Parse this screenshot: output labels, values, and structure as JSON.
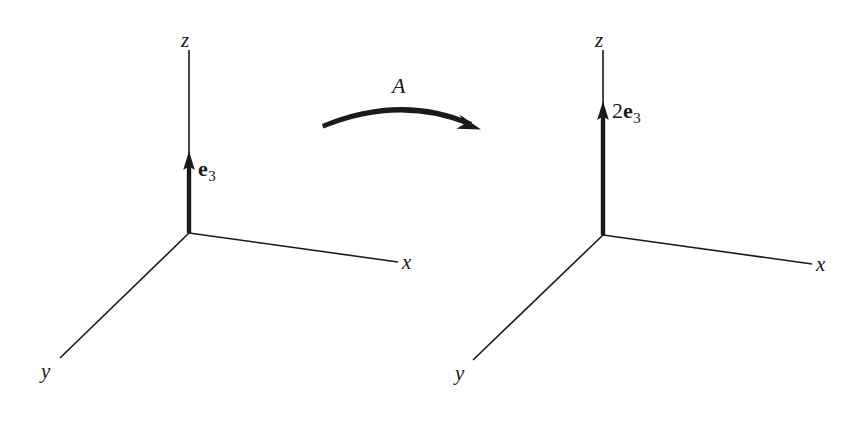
{
  "figure": {
    "background_color": "#ffffff",
    "ink_color": "#1a1a1a",
    "width": 866,
    "height": 426
  },
  "operator": {
    "label": "A"
  },
  "systems": [
    {
      "id": "left",
      "name": "domain-coordinate-system",
      "origin": {
        "x": 189,
        "y": 233
      },
      "axes": [
        {
          "name": "z",
          "label": "z",
          "end": {
            "x": 189,
            "y": 50
          },
          "label_pos": {
            "x": 181,
            "y": 30
          }
        },
        {
          "name": "x",
          "label": "x",
          "end": {
            "x": 398,
            "y": 262
          },
          "label_pos": {
            "x": 402,
            "y": 252
          }
        },
        {
          "name": "y",
          "label": "y",
          "end": {
            "x": 60,
            "y": 358
          },
          "label_pos": {
            "x": 41,
            "y": 361
          }
        }
      ],
      "vector": {
        "label_scalar": "",
        "label_basis": "e",
        "label_subscript": "3",
        "tip": {
          "x": 189,
          "y": 153
        },
        "label_pos": {
          "x": 198,
          "y": 158
        }
      }
    },
    {
      "id": "right",
      "name": "codomain-coordinate-system",
      "origin": {
        "x": 603,
        "y": 235
      },
      "axes": [
        {
          "name": "z",
          "label": "z",
          "end": {
            "x": 603,
            "y": 50
          },
          "label_pos": {
            "x": 595,
            "y": 30
          }
        },
        {
          "name": "x",
          "label": "x",
          "end": {
            "x": 812,
            "y": 264
          },
          "label_pos": {
            "x": 816,
            "y": 254
          }
        },
        {
          "name": "y",
          "label": "y",
          "end": {
            "x": 473,
            "y": 360
          },
          "label_pos": {
            "x": 455,
            "y": 363
          }
        }
      ],
      "vector": {
        "label_scalar": "2",
        "label_basis": "e",
        "label_subscript": "3",
        "tip": {
          "x": 603,
          "y": 103
        },
        "label_pos": {
          "x": 612,
          "y": 100
        }
      }
    }
  ],
  "arrow": {
    "name": "transformation-arrow",
    "start": {
      "x": 322,
      "y": 124
    },
    "control": {
      "x": 401,
      "y": 92
    },
    "end": {
      "x": 478,
      "y": 127
    },
    "label_pos": {
      "x": 392,
      "y": 75
    }
  }
}
